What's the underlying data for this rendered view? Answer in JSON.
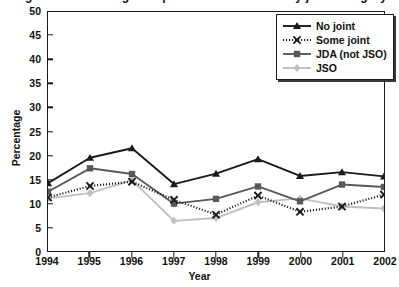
{
  "figure": {
    "title_sliver": "Figure 2. Percentage of operations conducted by joint category",
    "xlabel": "Year",
    "ylabel": "Percentage"
  },
  "axes": {
    "y_ticks": [
      "0",
      "5",
      "10",
      "15",
      "20",
      "25",
      "30",
      "35",
      "40",
      "45",
      "50"
    ],
    "x_ticks": [
      "1994",
      "1995",
      "1996",
      "1997",
      "1998",
      "1999",
      "2000",
      "2001",
      "2002"
    ]
  },
  "legend": {
    "items": [
      {
        "label": "No joint",
        "color": "#1a1a1a",
        "marker": "triangle",
        "dashed": false
      },
      {
        "label": "Some joint",
        "color": "#1a1a1a",
        "marker": "x",
        "dashed": true
      },
      {
        "label": "JDA (not JSO)",
        "color": "#595959",
        "marker": "square",
        "dashed": false
      },
      {
        "label": "JSO",
        "color": "#c0c0c0",
        "marker": "diamond",
        "dashed": false
      }
    ]
  },
  "chart_data": {
    "type": "line",
    "title": "Figure 2. Percentage of operations conducted by joint category",
    "xlabel": "Year",
    "ylabel": "Percentage",
    "categories": [
      "1994",
      "1995",
      "1996",
      "1997",
      "1998",
      "1999",
      "2000",
      "2001",
      "2002"
    ],
    "x": [
      1994,
      1995,
      1996,
      1997,
      1998,
      1999,
      2000,
      2001,
      2002
    ],
    "ylim": [
      0,
      50
    ],
    "ytick_step": 5,
    "grid": false,
    "legend_position": "top-right",
    "series": [
      {
        "name": "No joint",
        "color": "#1a1a1a",
        "marker": "triangle",
        "linestyle": "solid",
        "values": [
          14.2,
          19.5,
          21.5,
          14.0,
          16.2,
          19.2,
          15.7,
          16.5,
          15.6
        ]
      },
      {
        "name": "Some joint",
        "color": "#1a1a1a",
        "marker": "x",
        "linestyle": "dotted",
        "values": [
          11.2,
          13.6,
          14.5,
          10.7,
          7.6,
          11.6,
          8.2,
          9.3,
          11.8
        ]
      },
      {
        "name": "JDA (not JSO)",
        "color": "#595959",
        "marker": "square",
        "linestyle": "solid",
        "values": [
          12.4,
          17.3,
          16.1,
          9.9,
          10.9,
          13.5,
          10.4,
          13.9,
          13.4
        ]
      },
      {
        "name": "JSO",
        "color": "#c0c0c0",
        "marker": "diamond",
        "linestyle": "solid",
        "values": [
          11.0,
          12.1,
          14.8,
          6.3,
          6.9,
          10.2,
          11.0,
          9.3,
          8.9
        ]
      }
    ]
  }
}
